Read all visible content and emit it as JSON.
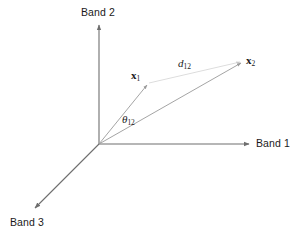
{
  "figure": {
    "kind": "spectral-feature-space-diagram",
    "axes": [
      {
        "id": "band1",
        "label": "Band 1",
        "direction": "right"
      },
      {
        "id": "band2",
        "label": "Band 2",
        "direction": "up"
      },
      {
        "id": "band3",
        "label": "Band 3",
        "direction": "lower-left"
      }
    ],
    "origin": {
      "x": 99,
      "y": 144
    },
    "vectors": [
      {
        "id": "x1",
        "label_base": "x",
        "label_sub": "1",
        "tip": {
          "x": 148,
          "y": 84
        }
      },
      {
        "id": "x2",
        "label_base": "x",
        "label_sub": "2",
        "tip": {
          "x": 243,
          "y": 62
        }
      }
    ],
    "annotations": [
      {
        "id": "d12",
        "label_base": "d",
        "label_sub": "12",
        "meaning": "euclidean-distance-between-x1-and-x2"
      },
      {
        "id": "theta12",
        "label_base": "θ",
        "label_sub": "12",
        "meaning": "spectral-angle-between-x1-and-x2"
      }
    ],
    "colors": {
      "axis": "#6e6e6e",
      "vector": "#9a9a9a",
      "distance_line": "#d8d8d8",
      "text": "#1a1a1a",
      "background": "#ffffff"
    }
  }
}
